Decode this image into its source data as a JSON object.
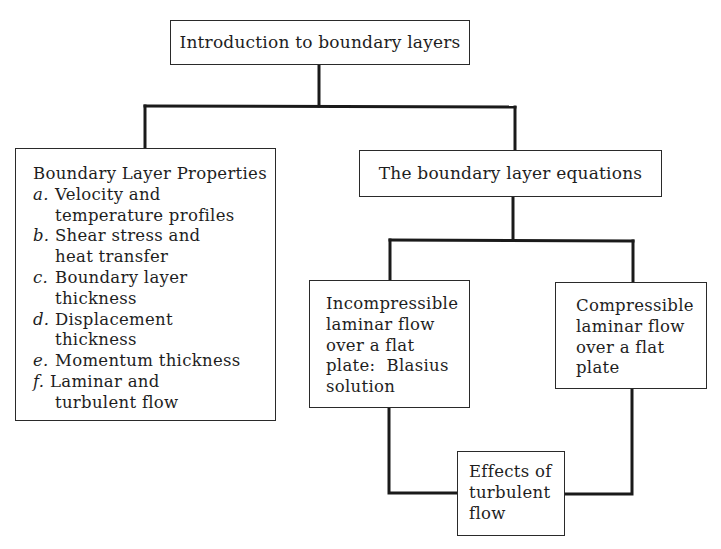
{
  "diagram": {
    "root": {
      "label": "Introduction to boundary layers"
    },
    "properties": {
      "heading": "Boundary Layer Properties",
      "items": [
        {
          "letter": "a.",
          "lines": [
            "Velocity and",
            "temperature profiles"
          ]
        },
        {
          "letter": "b.",
          "lines": [
            "Shear stress and",
            "heat transfer"
          ]
        },
        {
          "letter": "c.",
          "lines": [
            "Boundary layer",
            "thickness"
          ]
        },
        {
          "letter": "d.",
          "lines": [
            "Displacement",
            "thickness"
          ]
        },
        {
          "letter": "e.",
          "lines": [
            "Momentum thickness"
          ]
        },
        {
          "letter": "f.",
          "lines": [
            "Laminar and",
            "turbulent flow"
          ]
        }
      ]
    },
    "equations": {
      "label": "The boundary layer equations"
    },
    "incompressible": {
      "lines": [
        "Incompressible",
        "laminar flow",
        "over a flat",
        "plate:  Blasius",
        "solution"
      ]
    },
    "compressible": {
      "lines": [
        "Compressible",
        "laminar flow",
        "over a flat",
        "plate"
      ]
    },
    "turbulent": {
      "lines": [
        "Effects of",
        "turbulent",
        "flow"
      ]
    },
    "edges": [
      {
        "from": "Introduction to boundary layers",
        "to": "Boundary Layer Properties"
      },
      {
        "from": "Introduction to boundary layers",
        "to": "The boundary layer equations"
      },
      {
        "from": "The boundary layer equations",
        "to": "Incompressible laminar flow over a flat plate: Blasius solution"
      },
      {
        "from": "The boundary layer equations",
        "to": "Compressible laminar flow over a flat plate"
      },
      {
        "from": "Incompressible laminar flow over a flat plate: Blasius solution",
        "to": "Effects of turbulent flow"
      },
      {
        "from": "Compressible laminar flow over a flat plate",
        "to": "Effects of turbulent flow"
      }
    ],
    "colors": {
      "line": "#1a1a1a",
      "border": "#2a2a2a",
      "background": "#ffffff",
      "text": "#1e1e1e"
    }
  }
}
